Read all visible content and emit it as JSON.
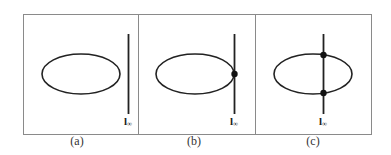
{
  "figure": {
    "panels": [
      {
        "id": "a",
        "caption": "(a)",
        "line_label": "l",
        "line_subscript": "∞",
        "relation": "line does not meet ellipse",
        "intersection_points": 0
      },
      {
        "id": "b",
        "caption": "(b)",
        "line_label": "l",
        "line_subscript": "∞",
        "relation": "line tangent to ellipse",
        "intersection_points": 1
      },
      {
        "id": "c",
        "caption": "(c)",
        "line_label": "l",
        "line_subscript": "∞",
        "relation": "line intersects ellipse",
        "intersection_points": 2
      }
    ],
    "colors": {
      "stroke": "#222222",
      "frame": "#888888",
      "background": "#ffffff"
    }
  }
}
